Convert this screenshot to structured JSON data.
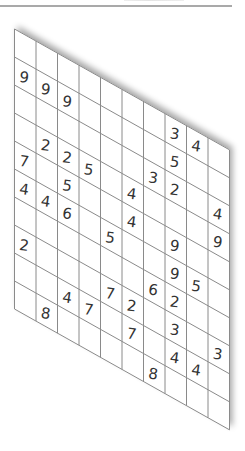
{
  "header": {
    "top_bar_color": "#a9a9a9"
  },
  "puzzle": {
    "type": "skewed-number-grid",
    "rows": 10,
    "cols": 10,
    "line_color": "#8a8a8a",
    "digit_color": "#333333",
    "grid": [
      [
        "",
        "",
        "",
        "",
        "",
        "",
        "",
        "3",
        "4",
        ""
      ],
      [
        "9",
        "9",
        "9",
        "",
        "",
        "",
        "",
        "5",
        "",
        ""
      ],
      [
        "",
        "",
        "",
        "",
        "",
        "",
        "3",
        "2",
        "",
        "4"
      ],
      [
        "",
        "2",
        "2",
        "5",
        "",
        "4",
        "",
        "",
        "",
        "9"
      ],
      [
        "7",
        "",
        "5",
        "",
        "",
        "4",
        "",
        "9",
        "",
        ""
      ],
      [
        "4",
        "4",
        "6",
        "",
        "5",
        "",
        "",
        "9",
        "5",
        ""
      ],
      [
        "",
        "",
        "",
        "",
        "",
        "",
        "6",
        "2",
        "",
        ""
      ],
      [
        "2",
        "",
        "",
        "",
        "7",
        "2",
        "",
        "3",
        "",
        "3"
      ],
      [
        "",
        "",
        "4",
        "7",
        "",
        "7",
        "",
        "4",
        "4",
        ""
      ],
      [
        "",
        "8",
        "",
        "",
        "",
        "",
        "8",
        "",
        "",
        ""
      ]
    ]
  }
}
